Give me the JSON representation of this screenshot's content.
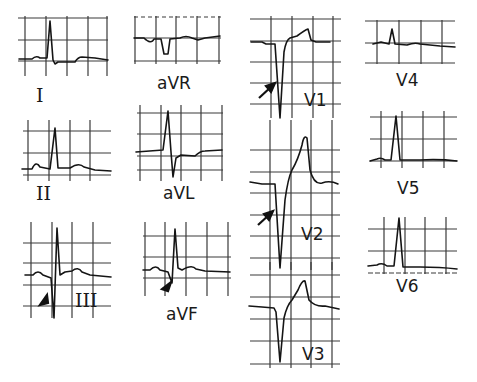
{
  "figure": {
    "type": "12-lead ECG panel",
    "stroke_color": "#151515",
    "grid_color": "#3a3a3a",
    "background": "#ffffff"
  },
  "leads": [
    {
      "id": "I",
      "label": "I",
      "annotation": null
    },
    {
      "id": "aVR",
      "label": "aVR",
      "annotation": null
    },
    {
      "id": "V1",
      "label": "V1",
      "annotation": "arrow"
    },
    {
      "id": "V4",
      "label": "V4",
      "annotation": null
    },
    {
      "id": "II",
      "label": "II",
      "annotation": null
    },
    {
      "id": "aVL",
      "label": "aVL",
      "annotation": null
    },
    {
      "id": "V2",
      "label": "V2",
      "annotation": "arrow"
    },
    {
      "id": "V5",
      "label": "V5",
      "annotation": null
    },
    {
      "id": "III",
      "label": "III",
      "annotation": "arrowhead"
    },
    {
      "id": "aVF",
      "label": "aVF",
      "annotation": "arrowhead"
    },
    {
      "id": "V3",
      "label": "V3",
      "annotation": null
    },
    {
      "id": "V6",
      "label": "V6",
      "annotation": null
    }
  ],
  "labels": {
    "I": "I",
    "aVR": "aVR",
    "V1": "V1",
    "V4": "V4",
    "II": "II",
    "aVL": "aVL",
    "V2": "V2",
    "V5": "V5",
    "III": "III",
    "aVF": "aVF",
    "V3": "V3",
    "V6": "V6"
  }
}
